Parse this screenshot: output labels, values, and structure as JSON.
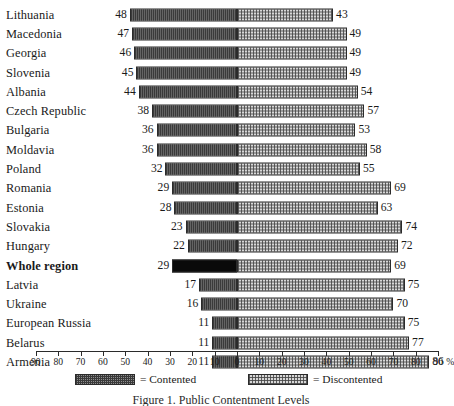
{
  "chart_data": {
    "type": "bar",
    "subtype": "diverging-horizontal-stacked",
    "title": "",
    "caption": "Figure 1. Public Contentment Levels",
    "xlabel": "",
    "ylabel": "",
    "unit": "%",
    "xlim": [
      -90,
      90
    ],
    "grid": false,
    "legend_position": "bottom",
    "categories": [
      "Lithuania",
      "Macedonia",
      "Georgia",
      "Slovenia",
      "Albania",
      "Czech Republic",
      "Bulgaria",
      "Moldavia",
      "Poland",
      "Romania",
      "Estonia",
      "Slovakia",
      "Hungary",
      "Whole region",
      "Latvia",
      "Ukraine",
      "European Russia",
      "Belarus",
      "Armenia"
    ],
    "series": [
      {
        "name": "Contented",
        "direction": "left",
        "values": [
          48,
          47,
          46,
          45,
          44,
          38,
          36,
          36,
          32,
          29,
          28,
          23,
          22,
          29,
          17,
          16,
          11,
          11,
          11
        ]
      },
      {
        "name": "Discontented",
        "direction": "right",
        "values": [
          43,
          49,
          49,
          49,
          54,
          57,
          53,
          58,
          55,
          69,
          63,
          74,
          72,
          69,
          75,
          70,
          75,
          77,
          86
        ]
      }
    ],
    "highlight_category": "Whole region",
    "axis_ticks": [
      90,
      80,
      70,
      60,
      50,
      40,
      30,
      20,
      10,
      0,
      10,
      20,
      30,
      40,
      50,
      60,
      70,
      80,
      90
    ],
    "legend": [
      {
        "label": "= Contented",
        "swatch": "dark-dither"
      },
      {
        "label": "= Discontented",
        "swatch": "light-dither"
      }
    ]
  },
  "colors": {
    "contented": "#8e8e8e",
    "discontented": "#d8d8d8",
    "highlight": "#0a0a0a",
    "outline": "#2b2b2b",
    "background": "#ffffff"
  }
}
